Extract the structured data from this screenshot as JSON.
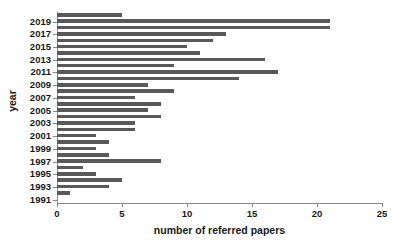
{
  "chart_data": {
    "type": "bar",
    "orientation": "horizontal",
    "title": "",
    "xlabel": "number of referred papers",
    "ylabel": "year",
    "xlim": [
      0,
      25
    ],
    "xticks": [
      0,
      5,
      10,
      15,
      20,
      25
    ],
    "xtick_labels": [
      "0",
      "5",
      "10",
      "15",
      "20",
      "25"
    ],
    "grid": false,
    "legend": null,
    "categories": [
      "2020",
      "2019",
      "2018",
      "2017",
      "2016",
      "2015",
      "2014",
      "2013",
      "2012",
      "2011",
      "2010",
      "2009",
      "2008",
      "2007",
      "2006",
      "2005",
      "2004",
      "2003",
      "2002",
      "2001",
      "2000",
      "1999",
      "1998",
      "1997",
      "1996",
      "1995",
      "1994",
      "1993",
      "1992",
      "1991"
    ],
    "values": [
      5,
      21,
      21,
      13,
      12,
      10,
      11,
      16,
      9,
      17,
      14,
      7,
      9,
      6,
      8,
      7,
      8,
      6,
      6,
      3,
      4,
      3,
      4,
      8,
      2,
      3,
      5,
      4,
      1,
      0
    ],
    "ytick_labels": [
      "2019",
      "2017",
      "2015",
      "2013",
      "2011",
      "2009",
      "2007",
      "2005",
      "2003",
      "2001",
      "1999",
      "1997",
      "1995",
      "1993",
      "1991"
    ],
    "ytick_categories": [
      "2019",
      "2017",
      "2015",
      "2013",
      "2011",
      "2009",
      "2007",
      "2005",
      "2003",
      "2001",
      "1999",
      "1997",
      "1995",
      "1993",
      "1991"
    ],
    "bar_color": "#595959",
    "axis_color": "#8a8a8a",
    "background_color": "#ffffff"
  }
}
